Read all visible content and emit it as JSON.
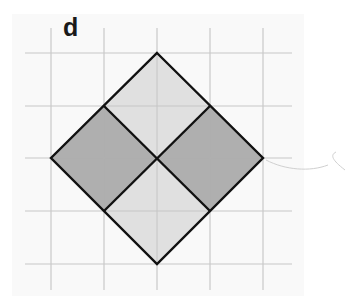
{
  "figure": {
    "label": "d",
    "grid": {
      "columns_x": [
        51,
        104,
        157,
        210,
        263
      ],
      "rows_y": [
        53,
        106,
        158,
        211,
        264
      ],
      "cell_size": 53,
      "line_color": "#c8c8c8"
    },
    "shape": {
      "description": "Diamond (square rotated 45°) divided into four smaller rotated squares",
      "outline_color": "#111111",
      "vertices": {
        "top": [
          157,
          53
        ],
        "right": [
          263,
          158
        ],
        "bottom": [
          157,
          264
        ],
        "left": [
          51,
          158
        ]
      },
      "sub_squares": [
        {
          "name": "top",
          "fill": "#dcdcdc"
        },
        {
          "name": "right",
          "fill": "#a6a6a6"
        },
        {
          "name": "bottom",
          "fill": "#dcdcdc"
        },
        {
          "name": "left",
          "fill": "#a6a6a6"
        }
      ]
    }
  }
}
